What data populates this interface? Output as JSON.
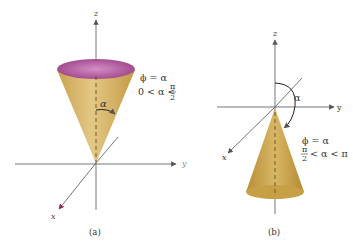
{
  "figure_a": {
    "caption": "(a)",
    "axis_z": "z",
    "axis_y": "y",
    "axis_x": "x",
    "angle_label": "α",
    "eq_line1": "ϕ = α",
    "eq_line2_prefix": "0 < α <",
    "frac_num": "π",
    "frac_den": "2",
    "colors": {
      "cone": "#d4b56a",
      "top_ellipse": "#b45aa0",
      "axis_x": "#8a2a4a"
    }
  },
  "figure_b": {
    "caption": "(b)",
    "axis_z": "z",
    "axis_y": "y",
    "axis_x": "x",
    "angle_label": "α",
    "eq_line1": "ϕ = α",
    "frac_num": "π",
    "frac_den": "2",
    "eq_line2_suffix": "< α < π",
    "colors": {
      "cone": "#c9a24a"
    }
  },
  "stray_label": "y"
}
